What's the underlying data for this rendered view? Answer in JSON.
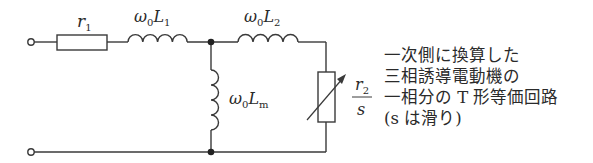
{
  "diagram": {
    "components": {
      "r1": {
        "symbol": "r",
        "sub": "1"
      },
      "L1": {
        "prefix": "ω",
        "prefix_sub": "0",
        "symbol": "L",
        "sub": "1"
      },
      "L2": {
        "prefix": "ω",
        "prefix_sub": "0",
        "symbol": "L",
        "sub": "2"
      },
      "Lm": {
        "prefix": "ω",
        "prefix_sub": "0",
        "symbol": "L",
        "sub": "m"
      },
      "r2s": {
        "numerator": "r",
        "numerator_sub": "2",
        "denominator": "s"
      }
    },
    "caption": {
      "lines": [
        "一次側に換算した",
        "三相誘導電動機の",
        "一相分の T 形等価回路",
        "(s は滑り)"
      ]
    },
    "colors": {
      "stroke": "#3a3a3a",
      "text": "#2a2a2a",
      "background": "#ffffff"
    }
  }
}
